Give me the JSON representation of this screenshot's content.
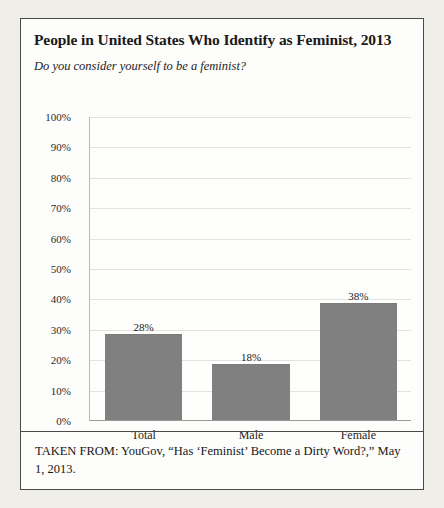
{
  "figure": {
    "title": "People in United States Who Identify as Feminist, 2013",
    "subtitle": "Do you consider yourself to be a feminist?",
    "source": "TAKEN FROM: YouGov, “Has ‘Feminist’ Become a Dirty Word?,” May 1, 2013."
  },
  "colors": {
    "bar_fill": "#808080",
    "frame_border": "#4a4a48",
    "gridline": "#e2e2df",
    "page_background": "#efeee9",
    "figure_background": "#fdfdfb"
  },
  "chart_data": {
    "type": "bar",
    "title": "People in United States Who Identify as Feminist, 2013",
    "subtitle": "Do you consider yourself to be a feminist?",
    "categories": [
      "Total",
      "Male",
      "Female"
    ],
    "values": [
      28,
      18,
      38
    ],
    "value_labels": [
      "28%",
      "18%",
      "38%"
    ],
    "xlabel": "",
    "ylabel": "",
    "ylim": [
      0,
      100
    ],
    "ytick_values": [
      100,
      90,
      80,
      70,
      60,
      50,
      40,
      30,
      20,
      10,
      0
    ],
    "ytick_labels": [
      "100%",
      "90%",
      "80%",
      "70%",
      "60%",
      "50%",
      "40%",
      "30%",
      "20%",
      "10%",
      "0%"
    ],
    "grid": true,
    "legend": false,
    "series": [
      {
        "name": "Identify as feminist",
        "values": [
          28,
          18,
          38
        ]
      }
    ]
  }
}
